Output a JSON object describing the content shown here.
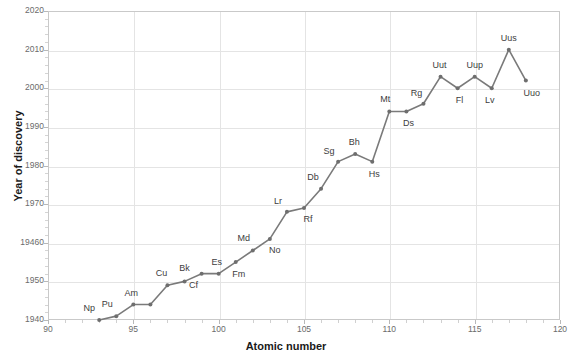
{
  "chart_data": {
    "type": "line",
    "title": "",
    "xlabel": "Atomic number",
    "ylabel": "Year of discovery",
    "xlim": [
      90,
      120
    ],
    "ylim": [
      1940,
      2020
    ],
    "xticks": [
      90,
      95,
      100,
      105,
      110,
      115,
      120
    ],
    "xtick_labels": [
      "90",
      "95",
      "100",
      "105",
      "110",
      "115",
      "120"
    ],
    "yticks": [
      1940,
      1950,
      1960,
      1970,
      1980,
      1990,
      2000,
      2010,
      2020
    ],
    "ytick_labels": [
      "1940",
      "1950",
      "19460",
      "1970",
      "1980",
      "1990",
      "2000",
      "2010",
      "2020"
    ],
    "grid": true,
    "legend": "none",
    "line_color": "#7a7a7a",
    "marker_color": "#6e6e6e",
    "categories": [
      93,
      94,
      95,
      96,
      97,
      98,
      99,
      100,
      101,
      102,
      103,
      104,
      105,
      106,
      107,
      108,
      109,
      110,
      111,
      113,
      114,
      115,
      116,
      117,
      118
    ],
    "values": [
      1940,
      1941,
      1944,
      1944,
      1949,
      1950,
      1952,
      1953,
      1955,
      1958,
      1968,
      1969,
      1974,
      1981,
      1982,
      1980,
      1994,
      1994,
      1996,
      2003,
      2000,
      2003,
      2000,
      2010,
      2002
    ],
    "labels": [
      "Np",
      "Pu",
      "Am",
      "Cu",
      "Cu",
      "Bk",
      "Cf",
      "Es",
      "Fm",
      "Md",
      "No",
      "Lr",
      "Rf",
      "Db",
      "Sg",
      "Bh",
      "Hs",
      "Mt",
      "Ds",
      "Rg",
      "Uut",
      "Fl",
      "Uup",
      "Lv",
      "Uus",
      "Uuo"
    ],
    "points": [
      {
        "label": "Np",
        "x": 93,
        "y": 1940,
        "lx": -10,
        "ly": -12
      },
      {
        "label": "Pu",
        "x": 94,
        "y": 1941,
        "lx": -9,
        "ly": -12
      },
      {
        "label": "Am",
        "x": 95,
        "y": 1944,
        "lx": -2,
        "ly": -12
      },
      {
        "label": "Cm",
        "x": 96,
        "y": 1944,
        "lx": 30,
        "ly": -13,
        "hidden": true
      },
      {
        "label": "Cu",
        "x": 97,
        "y": 1949,
        "lx": -6,
        "ly": -12
      },
      {
        "label": "Bk",
        "x": 98,
        "y": 1950,
        "lx": 0,
        "ly": -13
      },
      {
        "label": "Cf",
        "x": 99,
        "y": 1952,
        "lx": -8,
        "ly": 11
      },
      {
        "label": "Es",
        "x": 100,
        "y": 1952,
        "lx": -2,
        "ly": -12
      },
      {
        "label": "Fm",
        "x": 101,
        "y": 1955,
        "lx": 3,
        "ly": 12
      },
      {
        "label": "Md",
        "x": 102,
        "y": 1958,
        "lx": -9,
        "ly": -12
      },
      {
        "label": "No",
        "x": 103,
        "y": 1961,
        "lx": 5,
        "ly": 11
      },
      {
        "label": "Lr",
        "x": 104,
        "y": 1968,
        "lx": -9,
        "ly": -11
      },
      {
        "label": "Rf",
        "x": 105,
        "y": 1969,
        "lx": 4,
        "ly": 11
      },
      {
        "label": "Db",
        "x": 106,
        "y": 1974,
        "lx": -8,
        "ly": -12
      },
      {
        "label": "Sg",
        "x": 107,
        "y": 1981,
        "lx": -9,
        "ly": -11
      },
      {
        "label": "Bh",
        "x": 108,
        "y": 1983,
        "lx": -1,
        "ly": -12
      },
      {
        "label": "Hs",
        "x": 109,
        "y": 1981,
        "lx": 2,
        "ly": 12
      },
      {
        "label": "Mt",
        "x": 110,
        "y": 1994,
        "lx": -4,
        "ly": -12
      },
      {
        "label": "Ds",
        "x": 111,
        "y": 1994,
        "lx": 2,
        "ly": 12
      },
      {
        "label": "Rg",
        "x": 112,
        "y": 1996,
        "lx": -7,
        "ly": -11
      },
      {
        "label": "Uut",
        "x": 113,
        "y": 2003,
        "lx": -1,
        "ly": -12
      },
      {
        "label": "Fl",
        "x": 114,
        "y": 2000,
        "lx": 2,
        "ly": 12
      },
      {
        "label": "Uup",
        "x": 115,
        "y": 2003,
        "lx": 0,
        "ly": -12
      },
      {
        "label": "Lv",
        "x": 116,
        "y": 2000,
        "lx": -2,
        "ly": 12
      },
      {
        "label": "Uus",
        "x": 117,
        "y": 2010,
        "lx": 0,
        "ly": -12
      },
      {
        "label": "Uuo",
        "x": 118,
        "y": 2002,
        "lx": 6,
        "ly": 12
      }
    ]
  }
}
